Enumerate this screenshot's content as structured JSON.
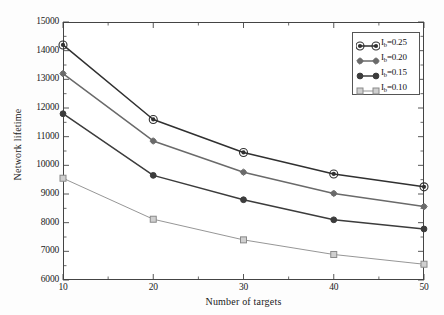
{
  "chart_data": {
    "type": "line",
    "title": "",
    "xlabel": "Number of targets",
    "ylabel": "Network lifetime",
    "x": [
      10,
      20,
      30,
      40,
      50
    ],
    "xlim": [
      10,
      50
    ],
    "ylim": [
      6000,
      15000
    ],
    "xticks": [
      "10",
      "20",
      "30",
      "40",
      "50"
    ],
    "yticks": [
      "6000",
      "7000",
      "8000",
      "9000",
      "10000",
      "11000",
      "12000",
      "13000",
      "14000",
      "15000"
    ],
    "x_minor_ticks": [
      15,
      25,
      35,
      45
    ],
    "y_minor_ticks": [
      6500,
      7500,
      8500,
      9500,
      10500,
      11500,
      12500,
      13500,
      14500
    ],
    "grid": false,
    "legend_position": "upper right",
    "series": [
      {
        "name": "I_b=0.10",
        "label_base": "I",
        "label_sub": "b",
        "label_value": "=0.10",
        "marker": "open-square",
        "color": "#8a8a8a",
        "values": [
          9550,
          8120,
          7400,
          6890,
          6550
        ]
      },
      {
        "name": "I_b=0.15",
        "label_base": "I",
        "label_sub": "b",
        "label_value": "=0.15",
        "marker": "filled-circle",
        "color": "#3c3c3c",
        "values": [
          11800,
          9650,
          8800,
          8100,
          7780
        ]
      },
      {
        "name": "I_b=0.20",
        "label_base": "I",
        "label_sub": "b",
        "label_value": "=0.20",
        "marker": "small-diamond",
        "color": "#6a6a6a",
        "values": [
          13200,
          10850,
          9760,
          9020,
          8560
        ]
      },
      {
        "name": "I_b=0.25",
        "label_base": "I",
        "label_sub": "b",
        "label_value": "=0.25",
        "marker": "open-circle",
        "color": "#303030",
        "values": [
          14200,
          11600,
          10450,
          9700,
          9250
        ]
      }
    ]
  },
  "figure": {
    "background": "#fdfdfd",
    "axis_color": "#444444"
  }
}
